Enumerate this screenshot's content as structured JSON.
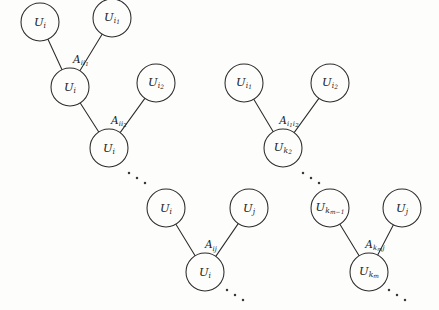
{
  "figure": {
    "type": "tree-diagram",
    "background_color": "#fdfdfc",
    "stroke_color": "#2b2b2b",
    "node_radius": 19
  },
  "clusters": [
    {
      "id": "cluster-1",
      "nodes": [
        {
          "id": "c1-top-left",
          "label_base": "U",
          "label_sub": "i",
          "cx": 40,
          "cy": 22
        },
        {
          "id": "c1-top-right",
          "label_base": "U",
          "label_sub": "i",
          "label_subsub": "1",
          "cx": 112,
          "cy": 18
        },
        {
          "id": "c1-mid",
          "label_base": "U",
          "label_sub": "i",
          "cx": 70,
          "cy": 87
        },
        {
          "id": "c1-right",
          "label_base": "U",
          "label_sub": "i",
          "label_subsub": "2",
          "cx": 156,
          "cy": 83
        },
        {
          "id": "c1-bottom",
          "label_base": "U",
          "label_sub": "i",
          "cx": 109,
          "cy": 148
        }
      ],
      "edges": [
        {
          "from": "c1-top-left",
          "to": "c1-mid"
        },
        {
          "from": "c1-top-right",
          "to": "c1-mid"
        },
        {
          "from": "c1-mid",
          "to": "c1-bottom"
        },
        {
          "from": "c1-right",
          "to": "c1-bottom"
        }
      ],
      "edge_labels": [
        {
          "id": "c1-label-1",
          "base": "A",
          "sub": "ii",
          "subsub": "1",
          "x": 81,
          "y": 61
        },
        {
          "id": "c1-label-2",
          "base": "A",
          "sub": "ii",
          "subsub": "2",
          "x": 119,
          "y": 122
        }
      ]
    },
    {
      "id": "cluster-2",
      "nodes": [
        {
          "id": "c2-top-left",
          "label_base": "U",
          "label_sub": "i",
          "label_subsub": "1",
          "cx": 244,
          "cy": 83
        },
        {
          "id": "c2-top-right",
          "label_base": "U",
          "label_sub": "i",
          "label_subsub": "2",
          "cx": 330,
          "cy": 83
        },
        {
          "id": "c2-bottom",
          "label_base": "U",
          "label_sub": "k",
          "label_subsub": "2",
          "cx": 283,
          "cy": 148
        }
      ],
      "edges": [
        {
          "from": "c2-top-left",
          "to": "c2-bottom"
        },
        {
          "from": "c2-top-right",
          "to": "c2-bottom"
        }
      ],
      "edge_labels": [
        {
          "id": "c2-label-1",
          "base": "A",
          "sub": "i",
          "subsub": "1",
          "sub2": "i",
          "subsub2": "2",
          "x": 289,
          "y": 122
        }
      ]
    },
    {
      "id": "cluster-3",
      "nodes": [
        {
          "id": "c3-top-left",
          "label_base": "U",
          "label_sub": "i",
          "cx": 166,
          "cy": 208
        },
        {
          "id": "c3-top-right",
          "label_base": "U",
          "label_sub": "j",
          "cx": 249,
          "cy": 208
        },
        {
          "id": "c3-bottom",
          "label_base": "U",
          "label_sub": "i",
          "cx": 205,
          "cy": 272
        }
      ],
      "edges": [
        {
          "from": "c3-top-left",
          "to": "c3-bottom"
        },
        {
          "from": "c3-top-right",
          "to": "c3-bottom"
        }
      ],
      "edge_labels": [
        {
          "id": "c3-label-1",
          "base": "A",
          "sub": "ij",
          "x": 211,
          "y": 246
        }
      ]
    },
    {
      "id": "cluster-4",
      "nodes": [
        {
          "id": "c4-top-left",
          "label_base": "U",
          "label_sub": "k",
          "label_subsub": "m−1",
          "cx": 330,
          "cy": 208
        },
        {
          "id": "c4-top-right",
          "label_base": "U",
          "label_sub": "j",
          "cx": 402,
          "cy": 208
        },
        {
          "id": "c4-bottom",
          "label_base": "U",
          "label_sub": "k",
          "label_subsub": "m",
          "cx": 369,
          "cy": 272
        }
      ],
      "edges": [
        {
          "from": "c4-top-left",
          "to": "c4-bottom"
        },
        {
          "from": "c4-top-right",
          "to": "c4-bottom"
        }
      ],
      "edge_labels": [
        {
          "id": "c4-label-1",
          "base": "A",
          "sub": "k",
          "subsub": "m",
          "sub2": "j",
          "x": 375,
          "y": 246
        }
      ]
    }
  ],
  "ellipses": [
    {
      "id": "ellipsis-mid-left",
      "dots": [
        {
          "x": 129,
          "y": 173
        },
        {
          "x": 137,
          "y": 178
        },
        {
          "x": 145,
          "y": 183
        }
      ]
    },
    {
      "id": "ellipsis-mid-right",
      "dots": [
        {
          "x": 303,
          "y": 173
        },
        {
          "x": 311,
          "y": 178
        },
        {
          "x": 319,
          "y": 183
        }
      ]
    },
    {
      "id": "ellipsis-bottom-left",
      "dots": [
        {
          "x": 227,
          "y": 290
        },
        {
          "x": 235,
          "y": 295
        },
        {
          "x": 243,
          "y": 300
        }
      ]
    },
    {
      "id": "ellipsis-bottom-right",
      "dots": [
        {
          "x": 389,
          "y": 290
        },
        {
          "x": 397,
          "y": 295
        },
        {
          "x": 405,
          "y": 300
        }
      ]
    }
  ]
}
